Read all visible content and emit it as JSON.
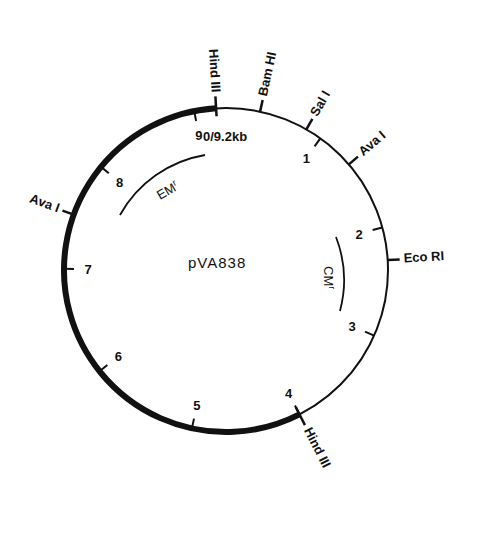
{
  "plasmid": {
    "name": "pVA838",
    "size_label": "0/9.2kb",
    "total_kb": 9.2
  },
  "scale_marks": [
    {
      "kb": 1,
      "label": "1"
    },
    {
      "kb": 2,
      "label": "2"
    },
    {
      "kb": 3,
      "label": "3"
    },
    {
      "kb": 4,
      "label": "4"
    },
    {
      "kb": 5,
      "label": "5"
    },
    {
      "kb": 6,
      "label": "6"
    },
    {
      "kb": 7,
      "label": "7"
    },
    {
      "kb": 8,
      "label": "8"
    },
    {
      "kb": 9,
      "label": "9"
    }
  ],
  "restriction_sites": [
    {
      "name": "Hind III",
      "kb": 0.0
    },
    {
      "name": "Bam HI",
      "kb": 0.4
    },
    {
      "name": "Sal I",
      "kb": 0.85
    },
    {
      "name": "Ava I",
      "kb": 1.35
    },
    {
      "name": "Eco RI",
      "kb": 2.3
    },
    {
      "name": "Hind III",
      "kb": 4.0
    },
    {
      "name": "Ava I",
      "kb": 7.5
    }
  ],
  "genes": [
    {
      "name": "EMr",
      "label_main": "EM",
      "label_sup": "r"
    },
    {
      "name": "CMr",
      "label_main": "CM",
      "label_sup": "r"
    }
  ],
  "thick_segment": {
    "from_kb": 4.0,
    "to_kb": 9.2,
    "description": "thick arc from Hind III (4 kb) counterclockwise to 0/9.2 kb"
  }
}
